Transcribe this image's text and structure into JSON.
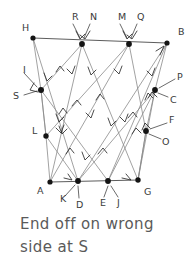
{
  "diagram": {
    "caption_lines": [
      "End off on wrong",
      "side at S"
    ],
    "colors": {
      "ink": "#3a3a3a",
      "edge": "#8a8a8a",
      "edge_dark": "#4a4a4a",
      "node": "#141414",
      "caption": "#5a5a5a",
      "background": "#ffffff"
    },
    "nodes": [
      {
        "id": "H",
        "x": 33,
        "y": 38,
        "label": "H",
        "lx": 22,
        "ly": 28
      },
      {
        "id": "RN",
        "x": 82,
        "y": 44,
        "labels": [
          {
            "text": "R",
            "lx": 72,
            "ly": 17
          },
          {
            "text": "N",
            "lx": 90,
            "ly": 17
          }
        ]
      },
      {
        "id": "MQ",
        "x": 129,
        "y": 44,
        "labels": [
          {
            "text": "M",
            "lx": 119,
            "ly": 17
          },
          {
            "text": "Q",
            "lx": 137,
            "ly": 17
          }
        ]
      },
      {
        "id": "B",
        "x": 167,
        "y": 43,
        "label": "B",
        "lx": 178,
        "ly": 32
      },
      {
        "id": "SI",
        "x": 41,
        "y": 90,
        "labels": [
          {
            "text": "I",
            "lx": 23,
            "ly": 70
          },
          {
            "text": "S",
            "lx": 14,
            "ly": 96
          }
        ]
      },
      {
        "id": "PC",
        "x": 155,
        "y": 90,
        "labels": [
          {
            "text": "P",
            "lx": 177,
            "ly": 78
          },
          {
            "text": "C",
            "lx": 172,
            "ly": 99
          }
        ]
      },
      {
        "id": "L",
        "x": 46,
        "y": 136,
        "label": "L",
        "lx": 33,
        "ly": 131
      },
      {
        "id": "FO",
        "x": 146,
        "y": 131,
        "labels": [
          {
            "text": "F",
            "lx": 170,
            "ly": 122
          },
          {
            "text": "O",
            "lx": 164,
            "ly": 141
          }
        ]
      },
      {
        "id": "A",
        "x": 50,
        "y": 182,
        "label": "A",
        "lx": 39,
        "ly": 191
      },
      {
        "id": "KD",
        "x": 78,
        "y": 181,
        "labels": [
          {
            "text": "K",
            "lx": 62,
            "ly": 198
          },
          {
            "text": "D",
            "lx": 79,
            "ly": 203
          }
        ]
      },
      {
        "id": "EJ",
        "x": 108,
        "y": 181,
        "labels": [
          {
            "text": "E",
            "lx": 103,
            "ly": 202
          },
          {
            "text": "J",
            "lx": 119,
            "ly": 202
          }
        ]
      },
      {
        "id": "G",
        "x": 138,
        "y": 180,
        "label": "G",
        "lx": 146,
        "ly": 191
      }
    ],
    "edges": [
      {
        "from": "H",
        "to": "B",
        "kind": "boundary-top"
      },
      {
        "from": "A",
        "to": "G",
        "kind": "boundary-bottom"
      },
      {
        "from": "H",
        "to": "SI",
        "kind": "boundary-left"
      },
      {
        "from": "SI",
        "to": "L",
        "kind": "boundary-left"
      },
      {
        "from": "L",
        "to": "A",
        "kind": "boundary-left"
      },
      {
        "from": "B",
        "to": "PC",
        "kind": "boundary-right"
      },
      {
        "from": "PC",
        "to": "FO",
        "kind": "boundary-right"
      },
      {
        "from": "FO",
        "to": "G",
        "kind": "boundary-right"
      },
      {
        "from": "H",
        "to": "KD",
        "kind": "diagonal-down-right"
      },
      {
        "from": "SI",
        "to": "EJ",
        "kind": "diagonal-down-right"
      },
      {
        "from": "RN",
        "to": "A",
        "kind": "diagonal-down-left"
      },
      {
        "from": "MQ",
        "to": "L",
        "kind": "diagonal-down-left"
      },
      {
        "from": "B",
        "to": "KD",
        "kind": "diagonal-down-left"
      },
      {
        "from": "RN",
        "to": "EJ",
        "kind": "diagonal-down-right"
      },
      {
        "from": "MQ",
        "to": "G",
        "kind": "diagonal-down-right"
      },
      {
        "from": "A",
        "to": "RN",
        "kind": "diagonal-up-right"
      },
      {
        "from": "KD",
        "to": "MQ",
        "kind": "diagonal-up-right"
      },
      {
        "from": "EJ",
        "to": "PC",
        "kind": "diagonal-up-right"
      },
      {
        "from": "L",
        "to": "KD",
        "kind": "diagonal-down-right"
      },
      {
        "from": "A",
        "to": "SI",
        "kind": "diagonal-up-left"
      },
      {
        "from": "G",
        "to": "PC",
        "kind": "diagonal-up-right"
      },
      {
        "from": "FO",
        "to": "B",
        "kind": "diagonal-up-right"
      }
    ],
    "node_count": 12,
    "label_count": 20
  }
}
